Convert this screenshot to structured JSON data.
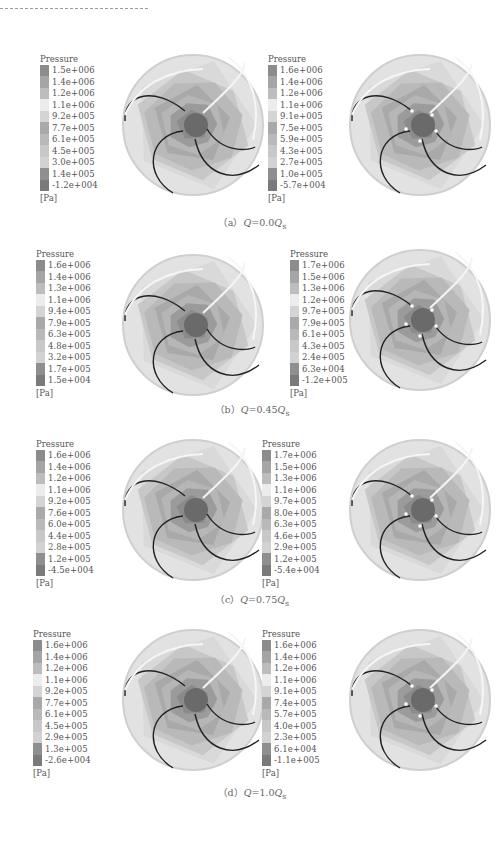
{
  "figure": {
    "legend_title": "Pressure",
    "unit": "[Pa]",
    "swatch_colors": [
      "#8c8c8c",
      "#a5a5a5",
      "#bdbdbd",
      "#ececec",
      "#d4d4d4",
      "#a9a9a9",
      "#b9b9b9",
      "#c8c8c8",
      "#d2d2d2",
      "#8f8f8f",
      "#7a7a7a"
    ],
    "captions": [
      {
        "label": "（a）",
        "q": "Q",
        "eq": "=0.0",
        "qs": "Q",
        "sub": "s"
      },
      {
        "label": "（b）",
        "q": "Q",
        "eq": "=0.45",
        "qs": "Q",
        "sub": "s"
      },
      {
        "label": "（c）",
        "q": "Q",
        "eq": "=0.75",
        "qs": "Q",
        "sub": "s"
      },
      {
        "label": "（d）",
        "q": "Q",
        "eq": "=1.0",
        "qs": "Q",
        "sub": "s"
      }
    ]
  },
  "chart_data": [
    {
      "type": "heatmap",
      "title": "(a) Q=0.0Qs, left",
      "legend_title": "Pressure",
      "unit": "Pa",
      "levels": [
        "1.5e+006",
        "1.4e+006",
        "1.2e+006",
        "1.1e+006",
        "9.2e+005",
        "7.7e+005",
        "6.1e+005",
        "4.5e+005",
        "3.0e+005",
        "1.4e+005",
        "-1.2e+004"
      ]
    },
    {
      "type": "heatmap",
      "title": "(a) Q=0.0Qs, right",
      "legend_title": "Pressure",
      "unit": "Pa",
      "levels": [
        "1.6e+006",
        "1.4e+006",
        "1.2e+006",
        "1.1e+006",
        "9.1e+005",
        "7.5e+005",
        "5.9e+005",
        "4.3e+005",
        "2.7e+005",
        "1.0e+005",
        "-5.7e+004"
      ]
    },
    {
      "type": "heatmap",
      "title": "(b) Q=0.45Qs, left",
      "legend_title": "Pressure",
      "unit": "Pa",
      "levels": [
        "1.6e+006",
        "1.4e+006",
        "1.3e+006",
        "1.1e+006",
        "9.4e+005",
        "7.9e+005",
        "6.3e+005",
        "4.8e+005",
        "3.2e+005",
        "1.7e+005",
        "1.5e+004"
      ]
    },
    {
      "type": "heatmap",
      "title": "(b) Q=0.45Qs, right",
      "legend_title": "Pressure",
      "unit": "Pa",
      "levels": [
        "1.7e+006",
        "1.5e+006",
        "1.3e+006",
        "1.2e+006",
        "9.7e+005",
        "7.9e+005",
        "6.1e+005",
        "4.3e+005",
        "2.4e+005",
        "6.3e+004",
        "-1.2e+005"
      ]
    },
    {
      "type": "heatmap",
      "title": "(c) Q=0.75Qs, left",
      "legend_title": "Pressure",
      "unit": "Pa",
      "levels": [
        "1.6e+006",
        "1.4e+006",
        "1.2e+006",
        "1.1e+006",
        "9.2e+005",
        "7.6e+005",
        "6.0e+005",
        "4.4e+005",
        "2.8e+005",
        "1.2e+005",
        "-4.5e+004"
      ]
    },
    {
      "type": "heatmap",
      "title": "(c) Q=0.75Qs, right",
      "legend_title": "Pressure",
      "unit": "Pa",
      "levels": [
        "1.7e+006",
        "1.5e+006",
        "1.3e+006",
        "1.1e+006",
        "9.7e+005",
        "8.0e+005",
        "6.3e+005",
        "4.6e+005",
        "2.9e+005",
        "1.2e+005",
        "-5.4e+004"
      ]
    },
    {
      "type": "heatmap",
      "title": "(d) Q=1.0Qs, left",
      "legend_title": "Pressure",
      "unit": "Pa",
      "levels": [
        "1.6e+006",
        "1.4e+006",
        "1.2e+006",
        "1.1e+006",
        "9.2e+005",
        "7.7e+005",
        "6.1e+005",
        "4.5e+005",
        "2.9e+005",
        "1.3e+005",
        "-2.6e+004"
      ]
    },
    {
      "type": "heatmap",
      "title": "(d) Q=1.0Qs, right",
      "legend_title": "Pressure",
      "unit": "Pa",
      "levels": [
        "1.6e+006",
        "1.4e+006",
        "1.2e+006",
        "1.1e+006",
        "9.1e+005",
        "7.4e+005",
        "5.7e+005",
        "4.0e+005",
        "2.3e+005",
        "6.1e+004",
        "-1.1e+005"
      ]
    }
  ]
}
